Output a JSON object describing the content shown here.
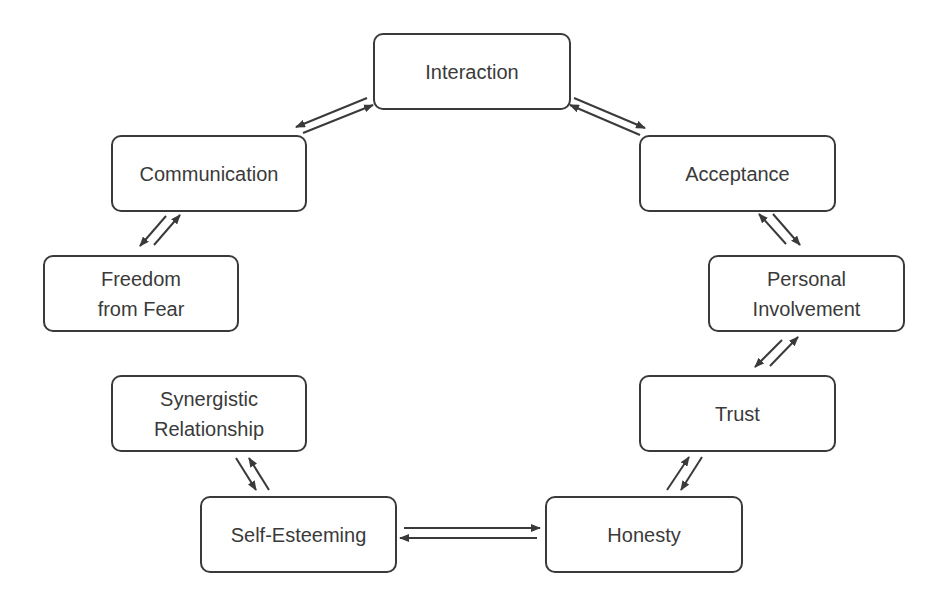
{
  "diagram": {
    "type": "cycle",
    "colors": {
      "stroke": "#3a3a3a",
      "text": "#3a3a3a",
      "background": "#ffffff"
    },
    "nodes": [
      {
        "id": "interaction",
        "label": "Interaction"
      },
      {
        "id": "acceptance",
        "label": "Acceptance"
      },
      {
        "id": "personal-involvement",
        "label": "Personal\nInvolvement"
      },
      {
        "id": "trust",
        "label": "Trust"
      },
      {
        "id": "honesty",
        "label": "Honesty"
      },
      {
        "id": "self-esteeming",
        "label": "Self-Esteeming"
      },
      {
        "id": "synergistic-relationship",
        "label": "Synergistic\nRelationship"
      },
      {
        "id": "freedom-from-fear",
        "label": "Freedom\nfrom Fear"
      },
      {
        "id": "communication",
        "label": "Communication"
      }
    ],
    "edges": [
      {
        "from": "interaction",
        "to": "acceptance",
        "bidirectional": true
      },
      {
        "from": "acceptance",
        "to": "personal-involvement",
        "bidirectional": true
      },
      {
        "from": "personal-involvement",
        "to": "trust",
        "bidirectional": true
      },
      {
        "from": "trust",
        "to": "honesty",
        "bidirectional": true
      },
      {
        "from": "honesty",
        "to": "self-esteeming",
        "bidirectional": true
      },
      {
        "from": "self-esteeming",
        "to": "synergistic-relationship",
        "bidirectional": true
      },
      {
        "from": "communication",
        "to": "freedom-from-fear",
        "bidirectional": true
      },
      {
        "from": "communication",
        "to": "interaction",
        "bidirectional": true
      }
    ]
  }
}
